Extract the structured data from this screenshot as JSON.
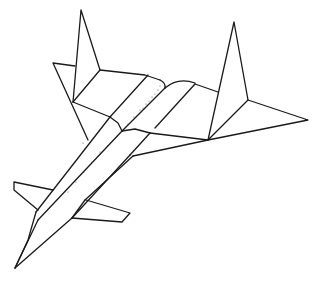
{
  "image": {
    "subject": "aircraft line drawing",
    "colors": {
      "background": "#ffffff",
      "stroke": "#1a1a1a",
      "stipple": "#555555"
    }
  }
}
